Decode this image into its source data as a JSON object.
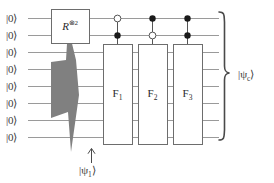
{
  "figure": {
    "type": "quantum-circuit-diagram",
    "background": "#ffffff",
    "wire_color": "#9a9a9a",
    "box_stroke": "#6d6d6d",
    "box_fill": "#ffffff",
    "wedge_fill": "#808080",
    "text_color": "#333333"
  },
  "qubits": {
    "count": 8,
    "labels": [
      "|0⟩",
      "|0⟩",
      "|0⟩",
      "|0⟩",
      "|0⟩",
      "|0⟩",
      "|0⟩",
      "|0⟩"
    ]
  },
  "gates": {
    "r_gate": {
      "base": "R",
      "superscript": "⊗2",
      "full": "R⊗2",
      "wires": [
        1,
        2
      ]
    },
    "f_gates": [
      {
        "base": "F",
        "subscript": "1",
        "full": "F1"
      },
      {
        "base": "F",
        "subscript": "2",
        "full": "F2"
      },
      {
        "base": "F",
        "subscript": "3",
        "full": "F3"
      }
    ],
    "controls": [
      {
        "index": 1,
        "top": "open",
        "bottom": "filled"
      },
      {
        "index": 2,
        "top": "filled",
        "bottom": "open"
      },
      {
        "index": 3,
        "top": "filled",
        "bottom": "filled"
      }
    ]
  },
  "annotations": {
    "output_state": {
      "base": "|ψ",
      "subscript": "c",
      "close": "⟩"
    },
    "intermediate_state": {
      "base": "|ψ",
      "subscript": "1",
      "close": "⟩"
    },
    "arrow": "↑"
  }
}
